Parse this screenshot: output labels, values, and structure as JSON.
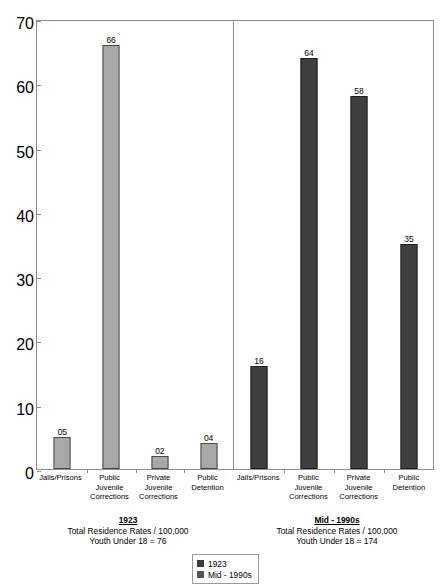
{
  "chart_data": {
    "type": "bar",
    "title": "",
    "xlabel": "",
    "ylabel": "",
    "ylim": [
      0,
      70
    ],
    "y_ticks": [
      0,
      10,
      20,
      30,
      40,
      50,
      60,
      70
    ],
    "grid": false,
    "legend_position": "bottom-center",
    "categories": [
      "Jails/Prisons",
      "Public Juvenile Corrections",
      "Private Juvenile Corrections",
      "Public Detention"
    ],
    "series": [
      {
        "name": "1923",
        "values": [
          5,
          66,
          2,
          4
        ],
        "color": "#a8a8a8"
      },
      {
        "name": "Mid - 1990s",
        "values": [
          16,
          64,
          58,
          35
        ],
        "color": "#3f3f3f"
      }
    ],
    "panels": [
      {
        "id": "panel-1923",
        "series_name": "1923",
        "caption_title": "1923",
        "caption_line1": "Total Residence Rates / 100,000",
        "caption_line2": "Youth Under 18 = 76",
        "bars": [
          {
            "category": "Jails/Prisons",
            "label_line1": "Jails/Prisons",
            "label_line2": "",
            "label_line3": "",
            "value": 5,
            "value_label": "05"
          },
          {
            "category": "Public Juvenile Corrections",
            "label_line1": "Public Juvenile",
            "label_line2": "Corrections",
            "label_line3": "",
            "value": 66,
            "value_label": "66"
          },
          {
            "category": "Private Juvenile Corrections",
            "label_line1": "Private",
            "label_line2": "Juvenile",
            "label_line3": "Corrections",
            "value": 2,
            "value_label": "02"
          },
          {
            "category": "Public Detention",
            "label_line1": "Public",
            "label_line2": "Detention",
            "label_line3": "",
            "value": 4,
            "value_label": "04"
          }
        ]
      },
      {
        "id": "panel-mid-1990s",
        "series_name": "Mid - 1990s",
        "caption_title": "Mid - 1990s",
        "caption_line1": "Total Residence Rates / 100,000",
        "caption_line2": "Youth Under 18 = 174",
        "bars": [
          {
            "category": "Jails/Prisons",
            "label_line1": "Jails/Prisons",
            "label_line2": "",
            "label_line3": "",
            "value": 16,
            "value_label": "16"
          },
          {
            "category": "Public Juvenile Corrections",
            "label_line1": "Public Juvenile",
            "label_line2": "Corrections",
            "label_line3": "",
            "value": 64,
            "value_label": "64"
          },
          {
            "category": "Private Juvenile Corrections",
            "label_line1": "Private",
            "label_line2": "Juvenile",
            "label_line3": "Corrections",
            "value": 58,
            "value_label": "58"
          },
          {
            "category": "Public Detention",
            "label_line1": "Public",
            "label_line2": "Detention",
            "label_line3": "",
            "value": 35,
            "value_label": "35"
          }
        ]
      }
    ],
    "legend": [
      {
        "label": "1923",
        "color": "#3a3a3a"
      },
      {
        "label": "Mid - 1990s",
        "color": "#555555"
      }
    ]
  }
}
